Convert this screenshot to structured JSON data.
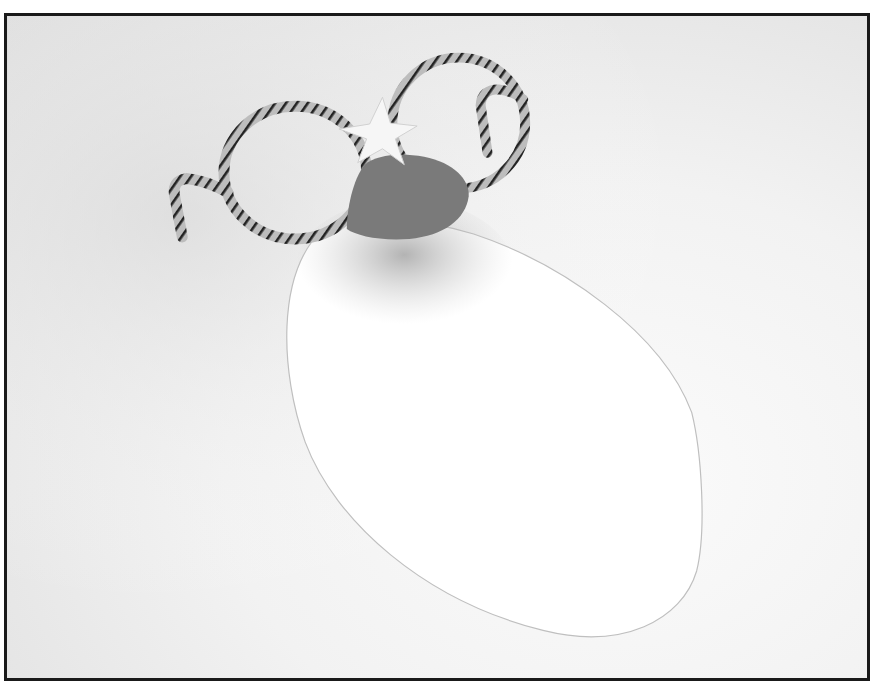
{
  "image": {
    "description": "Black-and-white photograph of a craft: pipe-cleaner eyeglasses with a paper star at the bridge and a grey felt nose, resting above a white paper oval (face/mustache shape) on a light background.",
    "style": "grayscale photograph with dark rectangular border",
    "colors": {
      "background": "#e6e6e6",
      "paper_oval": "#ffffff",
      "nose": "#7a7a7a",
      "star": "#f4f4f4",
      "pipe_cleaner": "#b9b9b9",
      "stripe": "#222222",
      "border": "#1a1a1a"
    },
    "objects": [
      "pipe-cleaner glasses",
      "paper star",
      "felt nose",
      "paper oval"
    ]
  }
}
